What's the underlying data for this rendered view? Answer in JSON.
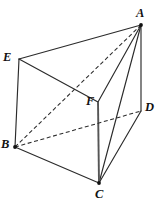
{
  "figure": {
    "type": "geometry-diagram",
    "canvas": {
      "width": 164,
      "height": 206
    },
    "colors": {
      "background": "#ffffff",
      "stroke": "#2b2b2b",
      "stroke_accent": "#555555",
      "label": "#111111"
    },
    "vertices": [
      {
        "id": "A",
        "label": "A",
        "x": 141,
        "y": 25,
        "label_x": 136,
        "label_y": 7,
        "dot": true
      },
      {
        "id": "E",
        "label": "E",
        "x": 19,
        "y": 59,
        "label_x": 3,
        "label_y": 51,
        "dot": false
      },
      {
        "id": "B",
        "label": "B",
        "x": 15,
        "y": 147,
        "label_x": 1,
        "label_y": 138,
        "dot": true
      },
      {
        "id": "C",
        "label": "C",
        "x": 99,
        "y": 183,
        "label_x": 95,
        "label_y": 188,
        "dot": true
      },
      {
        "id": "D",
        "label": "D",
        "x": 141,
        "y": 111,
        "label_x": 145,
        "label_y": 101,
        "dot": false
      },
      {
        "id": "F",
        "label": "F",
        "x": 98,
        "y": 102,
        "label_x": 86,
        "label_y": 95,
        "dot": false
      }
    ],
    "edges": [
      {
        "id": "EA",
        "from": "E",
        "to": "A",
        "style": "solid",
        "hidden": false
      },
      {
        "id": "EB",
        "from": "E",
        "to": "B",
        "style": "solid",
        "hidden": false
      },
      {
        "id": "EF",
        "from": "E",
        "to": "F",
        "style": "solid",
        "hidden": false
      },
      {
        "id": "FA",
        "from": "F",
        "to": "A",
        "style": "solid",
        "hidden": false
      },
      {
        "id": "AD",
        "from": "A",
        "to": "D",
        "style": "solid",
        "hidden": false
      },
      {
        "id": "AC",
        "from": "A",
        "to": "C",
        "style": "solid",
        "hidden": false
      },
      {
        "id": "BC",
        "from": "B",
        "to": "C",
        "style": "solid",
        "hidden": false
      },
      {
        "id": "CD",
        "from": "C",
        "to": "D",
        "style": "solid",
        "hidden": false
      },
      {
        "id": "FC",
        "from": "F",
        "to": "C",
        "style": "solid-thick",
        "hidden": false
      },
      {
        "id": "BA",
        "from": "B",
        "to": "A",
        "style": "dashed",
        "hidden": true
      },
      {
        "id": "BD",
        "from": "B",
        "to": "D",
        "style": "dashed",
        "hidden": true
      }
    ]
  }
}
